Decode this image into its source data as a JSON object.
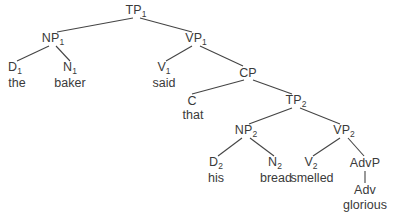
{
  "diagram": {
    "type": "syntax-tree",
    "sentence": "the baker said that his bread smelled glorious",
    "line_color": "#444444",
    "text_color": "#3a3a3a",
    "background": "#ffffff",
    "nodes": [
      {
        "id": "TP1",
        "base": "TP",
        "sub": "1",
        "x": 136,
        "y": 11
      },
      {
        "id": "NP1",
        "base": "NP",
        "sub": "1",
        "x": 53,
        "y": 39
      },
      {
        "id": "VP1",
        "base": "VP",
        "sub": "1",
        "x": 196,
        "y": 39
      },
      {
        "id": "D1",
        "base": "D",
        "sub": "1",
        "x": 15,
        "y": 68
      },
      {
        "id": "N1",
        "base": "N",
        "sub": "1",
        "x": 70,
        "y": 68
      },
      {
        "id": "V1",
        "base": "V",
        "sub": "1",
        "x": 164,
        "y": 68
      },
      {
        "id": "CP",
        "base": "CP",
        "sub": "",
        "x": 248,
        "y": 73
      },
      {
        "id": "C",
        "base": "C",
        "sub": "",
        "x": 192,
        "y": 101
      },
      {
        "id": "TP2",
        "base": "TP",
        "sub": "2",
        "x": 296,
        "y": 101
      },
      {
        "id": "NP2",
        "base": "NP",
        "sub": "2",
        "x": 246,
        "y": 131
      },
      {
        "id": "VP2",
        "base": "VP",
        "sub": "2",
        "x": 344,
        "y": 131
      },
      {
        "id": "D2",
        "base": "D",
        "sub": "2",
        "x": 216,
        "y": 163
      },
      {
        "id": "N2",
        "base": "N",
        "sub": "2",
        "x": 275,
        "y": 163
      },
      {
        "id": "V2",
        "base": "V",
        "sub": "2",
        "x": 311,
        "y": 163
      },
      {
        "id": "AdvP",
        "base": "AdvP",
        "sub": "",
        "x": 365,
        "y": 163
      },
      {
        "id": "Adv",
        "base": "Adv",
        "sub": "",
        "x": 365,
        "y": 190
      }
    ],
    "words": [
      {
        "id": "w-the",
        "text": "the",
        "x": 17,
        "y": 83
      },
      {
        "id": "w-baker",
        "text": "baker",
        "x": 70,
        "y": 83
      },
      {
        "id": "w-said",
        "text": "said",
        "x": 164,
        "y": 83
      },
      {
        "id": "w-that",
        "text": "that",
        "x": 193,
        "y": 115
      },
      {
        "id": "w-his",
        "text": "his",
        "x": 216,
        "y": 178
      },
      {
        "id": "w-bread",
        "text": "bread",
        "x": 276,
        "y": 178
      },
      {
        "id": "w-smelled",
        "text": "smelled",
        "x": 312,
        "y": 178
      },
      {
        "id": "w-glorious",
        "text": "glorious",
        "x": 365,
        "y": 205
      }
    ],
    "edges": [
      {
        "id": "TP1-NP1",
        "x1": 133,
        "y1": 18,
        "x2": 57,
        "y2": 32
      },
      {
        "id": "TP1-VP1",
        "x1": 140,
        "y1": 18,
        "x2": 192,
        "y2": 32
      },
      {
        "id": "NP1-D1",
        "x1": 49,
        "y1": 46,
        "x2": 17,
        "y2": 61
      },
      {
        "id": "NP1-N1",
        "x1": 56,
        "y1": 46,
        "x2": 70,
        "y2": 61
      },
      {
        "id": "VP1-V1",
        "x1": 192,
        "y1": 46,
        "x2": 166,
        "y2": 61
      },
      {
        "id": "VP1-CP",
        "x1": 200,
        "y1": 46,
        "x2": 243,
        "y2": 66
      },
      {
        "id": "CP-C",
        "x1": 244,
        "y1": 80,
        "x2": 192,
        "y2": 94
      },
      {
        "id": "CP-TP2",
        "x1": 253,
        "y1": 80,
        "x2": 292,
        "y2": 94
      },
      {
        "id": "TP2-NP2",
        "x1": 292,
        "y1": 108,
        "x2": 249,
        "y2": 124
      },
      {
        "id": "TP2-VP2",
        "x1": 300,
        "y1": 108,
        "x2": 340,
        "y2": 124
      },
      {
        "id": "NP2-D2",
        "x1": 242,
        "y1": 138,
        "x2": 218,
        "y2": 156
      },
      {
        "id": "NP2-N2",
        "x1": 250,
        "y1": 138,
        "x2": 274,
        "y2": 156
      },
      {
        "id": "VP2-V2",
        "x1": 340,
        "y1": 138,
        "x2": 313,
        "y2": 156
      },
      {
        "id": "VP2-AdvP",
        "x1": 348,
        "y1": 138,
        "x2": 364,
        "y2": 156
      },
      {
        "id": "AdvP-Adv",
        "x1": 365,
        "y1": 171,
        "x2": 365,
        "y2": 183
      }
    ]
  }
}
